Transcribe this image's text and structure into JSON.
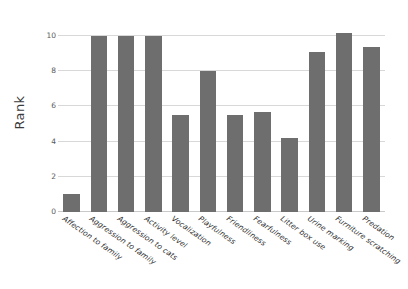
{
  "chart_data": {
    "type": "bar",
    "title": "",
    "xlabel": "",
    "ylabel": "Rank",
    "ylim": [
      0,
      10.8
    ],
    "yticks": [
      0,
      2,
      4,
      6,
      8,
      10
    ],
    "ytick_labels": [
      "0",
      "2",
      "4",
      "6",
      "8",
      "10"
    ],
    "grid": "horizontal",
    "legend": "none",
    "bar_color": "#6e6e6e",
    "grid_color": "#d8d8d8",
    "background_color": "#ffffff",
    "categories": [
      "Affection to family",
      "Aggression to family",
      "Aggression to cats",
      "Activity level",
      "Vocalization",
      "Playfulness",
      "Friendliness",
      "Fearfulness",
      "Litter box use",
      "Urine marking",
      "Furniture scratching",
      "Predation"
    ],
    "values": [
      1.0,
      10.0,
      10.0,
      10.0,
      5.5,
      8.0,
      5.5,
      5.7,
      4.2,
      9.1,
      10.2,
      9.4
    ]
  }
}
